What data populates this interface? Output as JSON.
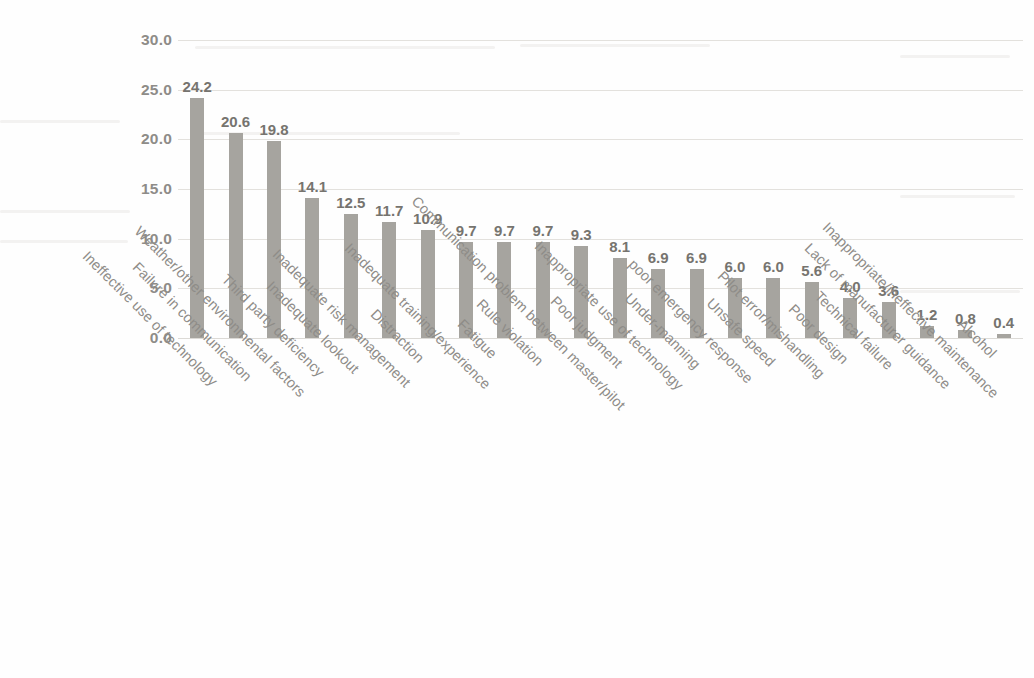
{
  "chart_data": {
    "type": "bar",
    "title": "",
    "subtitle": "",
    "xlabel": "",
    "ylabel": "",
    "ylim": [
      0,
      30
    ],
    "yticks": [
      "0.0",
      "5.0",
      "10.0",
      "15.0",
      "20.0",
      "25.0",
      "30.0"
    ],
    "ytick_values": [
      0,
      5,
      10,
      15,
      20,
      25,
      30
    ],
    "grid": true,
    "grid_axis": "y",
    "legend": false,
    "legend_position": "none",
    "orientation": "vertical",
    "bar_color": "#a6a49f",
    "value_label_color": "#76746f",
    "axis_label_color": "#8e8c88",
    "background_color": "#fefefe",
    "categories": [
      "Ineffective use of technology",
      "Failure in communication",
      "Weather/other environmental factors",
      "Third party deficiency",
      "Inadequate lookout",
      "Inadequate risk management",
      "Distraction",
      "Inadequate training/experience",
      "Fatigue",
      "Rule violation",
      "Communication problem between master/pilot",
      "Poor judgment",
      "Inappropriate use of technology",
      "Under-manning",
      "poor emergency response",
      "Unsafe speed",
      "Pilot error/mishandling",
      "Poor design",
      "Technical failure",
      "Lack of manufacturer guidance",
      "Inappropriate/ineffective maintenance",
      "Alcohol"
    ],
    "values": [
      24.2,
      20.6,
      19.8,
      14.1,
      12.5,
      11.7,
      10.9,
      9.7,
      9.7,
      9.7,
      9.3,
      8.1,
      6.9,
      6.9,
      6.0,
      6.0,
      5.6,
      4.0,
      3.6,
      1.2,
      0.8,
      0.4
    ],
    "value_labels": [
      "24.2",
      "20.6",
      "19.8",
      "14.1",
      "12.5",
      "11.7",
      "10.9",
      "9.7",
      "9.7",
      "9.7",
      "9.3",
      "8.1",
      "6.9",
      "6.9",
      "6.0",
      "6.0",
      "5.6",
      "4.0",
      "3.6",
      "1.2",
      "0.8",
      "0.4"
    ]
  }
}
